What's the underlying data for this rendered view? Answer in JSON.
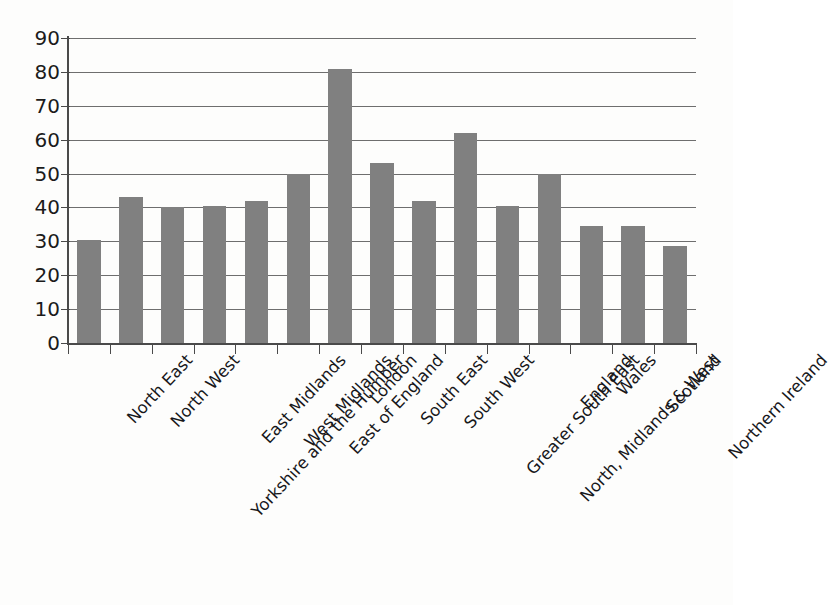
{
  "chart_data": {
    "type": "bar",
    "title": "",
    "subtitle": "",
    "xlabel": "",
    "ylabel": "",
    "ylim": [
      0,
      90
    ],
    "ytick_step": 10,
    "yticks": [
      0,
      10,
      20,
      30,
      40,
      50,
      60,
      70,
      80,
      90
    ],
    "ytick_labels": [
      "0",
      "10",
      "20",
      "30",
      "40",
      "50",
      "60",
      "70",
      "80",
      "90"
    ],
    "grid": true,
    "grid_axis": "y",
    "legend": false,
    "legend_position": "none",
    "orientation": "vertical",
    "bar_color": "#808080",
    "axis_color": "#4a4a4a",
    "label_rotation": -47,
    "categories": [
      "North East",
      "North West",
      "Yorkshire and the Humber",
      "East Midlands",
      "West Midlands",
      "East of England",
      "London",
      "South East",
      "South West",
      "Greater South East",
      "North, Midlands & West",
      "England",
      "Wales",
      "Scotland",
      "Northern Ireland"
    ],
    "values": [
      30.3,
      43,
      40,
      40.5,
      42,
      50,
      81,
      53,
      42,
      62,
      40.5,
      50,
      34.5,
      34.5,
      28.5
    ]
  }
}
